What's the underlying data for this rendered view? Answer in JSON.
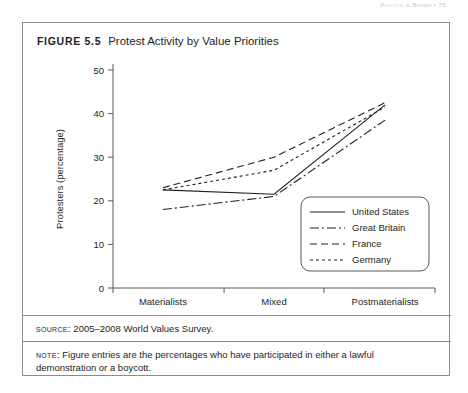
{
  "page": {
    "running_head": "Politics in Britain  •  75"
  },
  "figure": {
    "label_prefix": "Figure",
    "number": "5.5",
    "caption": "Protest Activity by Value Priorities",
    "source_label": "Source:",
    "source_text": "2005–2008 World Values Survey.",
    "note_label": "Note:",
    "note_text": "Figure entries are the percentages who have participated in either a lawful demonstration or a boycott."
  },
  "chart_data": {
    "type": "line",
    "title": "Protest Activity by Value Priorities",
    "xlabel": "",
    "ylabel": "Protesters (percentage)",
    "categories": [
      "Materialists",
      "Mixed",
      "Postmaterialists"
    ],
    "ylim": [
      0,
      50
    ],
    "yticks": [
      0,
      10,
      20,
      30,
      40,
      50
    ],
    "ytick_labels": [
      "0",
      "10",
      "20",
      "30",
      "40",
      "50"
    ],
    "grid": false,
    "legend_position": "inside-right",
    "series": [
      {
        "name": "United States",
        "dash_style": "solid",
        "dasharray": "none",
        "values": [
          22.5,
          21.5,
          42.0
        ]
      },
      {
        "name": "Great Britain",
        "dash_style": "dash-dot",
        "dasharray": "9,3,2,3",
        "values": [
          18.0,
          21.0,
          38.5
        ]
      },
      {
        "name": "France",
        "dash_style": "dashed",
        "dasharray": "7,4",
        "values": [
          23.0,
          30.0,
          42.5
        ]
      },
      {
        "name": "Germany",
        "dash_style": "dotted",
        "dasharray": "3,3",
        "values": [
          22.5,
          27.0,
          41.5
        ]
      }
    ]
  }
}
